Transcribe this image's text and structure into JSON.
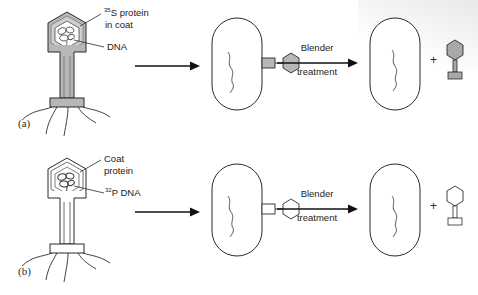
{
  "figure": {
    "background_color": "#ffffff",
    "ink_color": "#2b2b2b",
    "shaded_fill": "#b5b5b5",
    "unshaded_fill": "#ffffff"
  },
  "panels": [
    {
      "tag": "(a)",
      "phage": {
        "label_top": "S protein",
        "label_top_sup": "35",
        "label_top_line2": "in coat",
        "label_bottom": "DNA",
        "label_bottom_sup": "",
        "coat_shaded": true,
        "dna_shaded": false
      },
      "arrow1": {
        "label": ""
      },
      "bacterium_infected": {
        "caption": ""
      },
      "blender_arrow": {
        "line1": "Blender",
        "line2": "treatment"
      },
      "bacterium_result": {
        "caption": ""
      },
      "plus": "+",
      "ghost": {
        "shaded": true
      }
    },
    {
      "tag": "(b)",
      "phage": {
        "label_top": "Coat",
        "label_top_sup": "",
        "label_top_line2": "protein",
        "label_bottom": "P DNA",
        "label_bottom_sup": "32",
        "coat_shaded": false,
        "dna_shaded": true
      },
      "arrow1": {
        "label": ""
      },
      "bacterium_infected": {
        "caption": ""
      },
      "blender_arrow": {
        "line1": "Blender",
        "line2": "treatment"
      },
      "bacterium_result": {
        "caption": ""
      },
      "plus": "+",
      "ghost": {
        "shaded": false
      }
    }
  ]
}
